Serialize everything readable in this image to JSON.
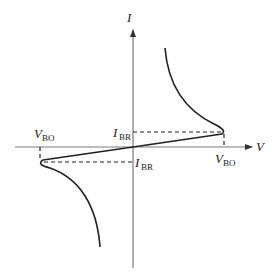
{
  "diagram": {
    "title": "",
    "axes": {
      "x_label": "V",
      "y_label": "I"
    },
    "labels": {
      "ibr_upper": {
        "main": "I",
        "sub": "BR"
      },
      "ibr_lower": {
        "main": "I",
        "sub": "BR"
      },
      "vbo_left": {
        "main": "V",
        "sub": "BO"
      },
      "vbo_right": {
        "main": "V",
        "sub": "BO"
      }
    },
    "colors": {
      "curve": "#222222",
      "axis": "#7a7a7a",
      "background": "#ffffff"
    }
  }
}
